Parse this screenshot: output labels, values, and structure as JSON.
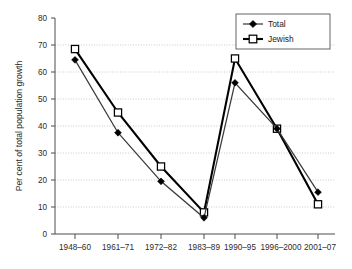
{
  "chart_data": {
    "type": "line",
    "title": "",
    "xlabel": "",
    "ylabel": "Per cent of total population growth",
    "categories": [
      "1948–60",
      "1961–71",
      "1972–82",
      "1983–89",
      "1990–95",
      "1996–2000",
      "2001–07"
    ],
    "series": [
      {
        "name": "Total",
        "values": [
          64.5,
          37.5,
          19.5,
          6.0,
          56.0,
          39.0,
          15.5
        ],
        "marker": "filled-diamond",
        "color": "#3a3a3a"
      },
      {
        "name": "Jewish",
        "values": [
          68.5,
          45.0,
          25.0,
          8.0,
          65.0,
          39.0,
          11.0
        ],
        "marker": "open-square",
        "color": "#000000"
      }
    ],
    "ylim": [
      0,
      80
    ],
    "yticks": [
      0,
      10,
      20,
      30,
      40,
      50,
      60,
      70,
      80
    ],
    "ytick_labels": [
      "0",
      "10",
      "20",
      "30",
      "40",
      "50",
      "60",
      "70",
      "80"
    ],
    "grid": "horizontal-dotted",
    "legend_position": "top-right",
    "legend_entries": [
      "Total",
      "Jewish"
    ]
  }
}
